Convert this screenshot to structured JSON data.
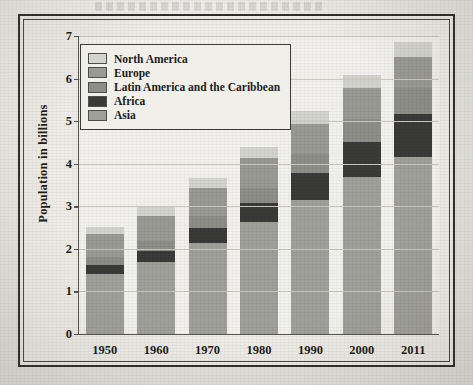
{
  "chart_data": {
    "type": "bar",
    "subtype": "stacked-bar",
    "title": "",
    "xlabel": "",
    "ylabel": "Population in billions",
    "categories": [
      "1950",
      "1960",
      "1970",
      "1980",
      "1990",
      "2000",
      "2011"
    ],
    "ylim": [
      0,
      7
    ],
    "yticks": [
      0,
      1,
      2,
      3,
      4,
      5,
      6,
      7
    ],
    "ytick_labels": [
      "0",
      "1",
      "2",
      "3",
      "4",
      "5",
      "6",
      "7"
    ],
    "grid": true,
    "legend_position": "upper-left-inside",
    "stack_order_bottom_to_top": [
      "Asia",
      "Africa",
      "Latin America and the Caribbean",
      "Europe",
      "North America"
    ],
    "series": [
      {
        "name": "Asia",
        "color": "#a0a09a",
        "values": [
          1.4,
          1.7,
          2.13,
          2.63,
          3.15,
          3.7,
          4.15
        ]
      },
      {
        "name": "Africa",
        "color": "#3a3a38",
        "values": [
          0.23,
          0.26,
          0.36,
          0.45,
          0.63,
          0.82,
          1.02
        ]
      },
      {
        "name": "Latin America and the Caribbean",
        "color": "#8e8e88",
        "values": [
          0.17,
          0.22,
          0.29,
          0.36,
          0.44,
          0.52,
          0.6
        ]
      },
      {
        "name": "Europe",
        "color": "#9a9a94",
        "values": [
          0.55,
          0.6,
          0.65,
          0.7,
          0.72,
          0.73,
          0.73
        ]
      },
      {
        "name": "North America",
        "color": "#d4d4ce",
        "values": [
          0.17,
          0.2,
          0.23,
          0.26,
          0.29,
          0.32,
          0.35
        ]
      }
    ],
    "totals": [
      2.52,
      2.98,
      3.66,
      4.4,
      5.23,
      6.09,
      6.85
    ],
    "legend_entries": [
      {
        "label": "North America",
        "color": "#d4d4ce"
      },
      {
        "label": "Europe",
        "color": "#9a9a94"
      },
      {
        "label": "Latin America and the Caribbean",
        "color": "#8e8e88"
      },
      {
        "label": "Africa",
        "color": "#3a3a38"
      },
      {
        "label": "Asia",
        "color": "#a0a09a"
      }
    ]
  }
}
